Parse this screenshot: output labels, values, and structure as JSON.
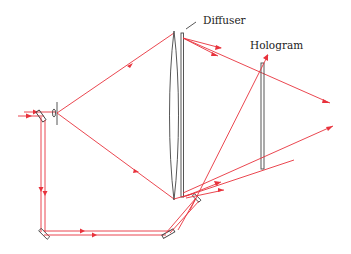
{
  "diagram": {
    "labels": {
      "diffuser": "Diffuser",
      "hologram": "Hologram"
    },
    "components": [
      "laser-input",
      "beam-splitter",
      "spatial-filter",
      "lens",
      "diffuser",
      "hologram",
      "mirror-1",
      "mirror-2",
      "mirror-3"
    ],
    "colors": {
      "beam": "#e8323c",
      "optics": "#444444",
      "text": "#222222"
    }
  }
}
